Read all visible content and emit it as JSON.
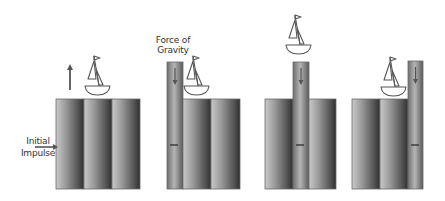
{
  "labels": {
    "initial_impulse_line1": "Initial",
    "initial_impulse_line2": "Impulse",
    "force_of_gravity_line1": "Force of",
    "force_of_gravity_line2": "Gravity"
  },
  "colors": {
    "column_dark": "#3a3a3a",
    "column_mid": "#8a8a8a",
    "column_light": "#d4d4d4",
    "column_border": "#6a6a6a",
    "arrow": "#555555",
    "boat_stroke": "#555555",
    "text": "#333333"
  },
  "panels": [
    {
      "id": "panel-1",
      "description": "Initial impulse lifts the boat upward",
      "columns": [
        {
          "x": 56,
          "y": 99,
          "w": 28,
          "h": 90,
          "kind": "wide"
        },
        {
          "x": 84,
          "y": 99,
          "w": 28,
          "h": 90,
          "kind": "wide"
        },
        {
          "x": 112,
          "y": 99,
          "w": 28,
          "h": 90,
          "kind": "wide"
        }
      ],
      "boat": {
        "x": 85,
        "y": 55
      },
      "arrow": {
        "direction": "up",
        "x": 70,
        "y1": 90,
        "y2": 64
      }
    },
    {
      "id": "panel-2",
      "description": "Tall column shown with force of gravity",
      "columns": [
        {
          "x": 167,
          "y": 62,
          "w": 16,
          "h": 127,
          "kind": "narrow",
          "marks": [
            82,
            145
          ]
        },
        {
          "x": 183,
          "y": 99,
          "w": 28,
          "h": 90,
          "kind": "wide"
        },
        {
          "x": 211,
          "y": 99,
          "w": 29,
          "h": 90,
          "kind": "wide"
        }
      ],
      "boat": {
        "x": 184,
        "y": 55
      }
    },
    {
      "id": "panel-3",
      "description": "Boat lifted above the raised narrow column",
      "columns": [
        {
          "x": 265,
          "y": 99,
          "w": 28,
          "h": 90,
          "kind": "wide"
        },
        {
          "x": 293,
          "y": 62,
          "w": 16,
          "h": 127,
          "kind": "narrow",
          "marks": [
            82,
            145
          ]
        },
        {
          "x": 309,
          "y": 99,
          "w": 27,
          "h": 90,
          "kind": "wide"
        }
      ],
      "boat": {
        "x": 286,
        "y": 14
      }
    },
    {
      "id": "panel-4",
      "description": "Boat returns next to tall column on the right",
      "columns": [
        {
          "x": 352,
          "y": 99,
          "w": 28,
          "h": 90,
          "kind": "wide"
        },
        {
          "x": 380,
          "y": 99,
          "w": 28,
          "h": 90,
          "kind": "wide"
        },
        {
          "x": 408,
          "y": 61,
          "w": 15,
          "h": 128,
          "kind": "narrow",
          "marks": [
            82,
            145
          ]
        }
      ],
      "boat": {
        "x": 381,
        "y": 56
      }
    }
  ]
}
